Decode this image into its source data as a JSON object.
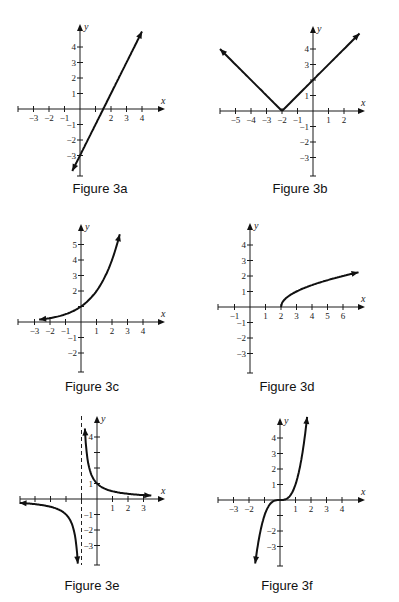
{
  "chart_data": [
    {
      "type": "line",
      "title": "Figure 3a",
      "function": "y = 2x - 3",
      "xlabel": "x",
      "ylabel": "y",
      "xlim": [
        -4,
        5
      ],
      "ylim": [
        -4,
        5
      ],
      "x_ticks": [
        -3,
        -2,
        -1,
        2,
        3,
        4
      ],
      "y_ticks": [
        -3,
        -2,
        -1,
        1,
        2,
        3,
        4
      ],
      "x_tick_unlabeled": [
        1
      ],
      "y_tick_unlabeled": [],
      "curve_domain": [
        -0.5,
        4
      ],
      "points": [
        [
          -0.5,
          -4
        ],
        [
          0,
          -3
        ],
        [
          1.5,
          0
        ],
        [
          4,
          5
        ]
      ],
      "arrows": [
        "start",
        "end"
      ],
      "asymptotes": []
    },
    {
      "type": "line",
      "title": "Figure 3b",
      "function": "y = |x + 2|",
      "xlabel": "x",
      "ylabel": "y",
      "xlim": [
        -6,
        3
      ],
      "ylim": [
        -4,
        5
      ],
      "x_ticks": [
        -5,
        -4,
        -3,
        -2,
        -1,
        1,
        2
      ],
      "y_ticks": [
        -3,
        -2,
        -1,
        1,
        3,
        4
      ],
      "x_tick_unlabeled": [],
      "y_tick_unlabeled": [
        2
      ],
      "curve_domain": [
        -6,
        3
      ],
      "points": [
        [
          -6,
          4
        ],
        [
          -2,
          0
        ],
        [
          0,
          2
        ],
        [
          3,
          5
        ]
      ],
      "arrows": [
        "start",
        "end"
      ],
      "asymptotes": []
    },
    {
      "type": "line",
      "title": "Figure 3c",
      "function": "y = 2^x",
      "xlabel": "x",
      "ylabel": "y",
      "xlim": [
        -4,
        5
      ],
      "ylim": [
        -3,
        6
      ],
      "x_ticks": [
        -3,
        -2,
        -1,
        1,
        2,
        3,
        4
      ],
      "y_ticks": [
        -2,
        -1,
        2,
        3,
        4,
        5
      ],
      "x_tick_unlabeled": [],
      "y_tick_unlabeled": [
        1
      ],
      "curve_domain": [
        -2.7,
        2.5
      ],
      "points": [
        [
          -2.7,
          0.15
        ],
        [
          0,
          1
        ],
        [
          1,
          2
        ],
        [
          2,
          4
        ],
        [
          2.5,
          5.66
        ]
      ],
      "arrows": [
        "start",
        "end"
      ],
      "asymptotes": []
    },
    {
      "type": "line",
      "title": "Figure 3d",
      "function": "y = sqrt(x - 2)",
      "xlabel": "x",
      "ylabel": "y",
      "xlim": [
        -2,
        7
      ],
      "ylim": [
        -4,
        5
      ],
      "x_ticks": [
        -1,
        1,
        2,
        3,
        4,
        5,
        6
      ],
      "y_ticks": [
        -3,
        -2,
        -1,
        1,
        2,
        3,
        4
      ],
      "x_tick_unlabeled": [],
      "y_tick_unlabeled": [],
      "curve_domain": [
        2,
        7
      ],
      "points": [
        [
          2,
          0
        ],
        [
          3,
          1
        ],
        [
          6,
          2
        ],
        [
          7,
          2.24
        ]
      ],
      "arrows": [
        "end"
      ],
      "asymptotes": []
    },
    {
      "type": "line",
      "title": "Figure 3e",
      "function": "y = 1/(x + 1)",
      "xlabel": "x",
      "ylabel": "y",
      "xlim": [
        -5,
        4
      ],
      "ylim": [
        -4,
        5
      ],
      "x_ticks": [
        1,
        2,
        3
      ],
      "y_ticks": [
        -3,
        -2,
        -1,
        1,
        4
      ],
      "x_tick_unlabeled": [
        -4,
        -3,
        -2,
        -1
      ],
      "y_tick_unlabeled": [
        2,
        3
      ],
      "curve_domain": [
        [
          -5,
          -1.24
        ],
        [
          -0.78,
          3.5
        ]
      ],
      "points": [
        [
          -5,
          -0.25
        ],
        [
          -2,
          -1
        ],
        [
          -1.25,
          -4
        ],
        [
          -0.78,
          4.5
        ],
        [
          0,
          1
        ],
        [
          1,
          0.5
        ],
        [
          3.5,
          0.22
        ]
      ],
      "arrows": [
        "start",
        "end"
      ],
      "asymptotes": [
        {
          "type": "vertical",
          "x": -1
        }
      ]
    },
    {
      "type": "line",
      "title": "Figure 3f",
      "function": "y = x^3",
      "xlabel": "x",
      "ylabel": "y",
      "xlim": [
        -4,
        5
      ],
      "ylim": [
        -4,
        5
      ],
      "x_ticks": [
        -3,
        -2,
        1,
        2,
        3,
        4
      ],
      "y_ticks": [
        -3,
        -2,
        1,
        2,
        3,
        4
      ],
      "x_tick_unlabeled": [
        -1
      ],
      "y_tick_unlabeled": [
        -1
      ],
      "curve_domain": [
        -1.6,
        1.75
      ],
      "points": [
        [
          -1.6,
          -4.1
        ],
        [
          -1,
          -1
        ],
        [
          0,
          0
        ],
        [
          1,
          1
        ],
        [
          1.75,
          5.36
        ]
      ],
      "arrows": [
        "start",
        "end"
      ],
      "asymptotes": []
    }
  ]
}
